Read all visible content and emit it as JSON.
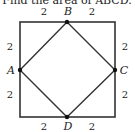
{
  "caption": "Find the area of ABCD.",
  "square": {
    "x1": 20,
    "y1": 22,
    "x2": 115,
    "y2": 117,
    "stroke": "#333333"
  },
  "points": [
    {
      "name": "A",
      "x": 20,
      "y": 70,
      "label_x": 12,
      "label_y": 74
    },
    {
      "name": "B",
      "x": 67,
      "y": 22,
      "label_x": 67,
      "label_y": 14
    },
    {
      "name": "C",
      "x": 115,
      "y": 70,
      "label_x": 123,
      "label_y": 74
    },
    {
      "name": "D",
      "x": 67,
      "y": 117,
      "label_x": 67,
      "label_y": 130
    }
  ],
  "segment_labels": {
    "top_left": "2",
    "top_right": "2",
    "left_top": "2",
    "left_bottom": "2",
    "right_top": "2",
    "right_bottom": "2",
    "bottom_left": "2",
    "bottom_right": "2"
  },
  "colors": {
    "line": "#333333",
    "point": "#111111",
    "text": "#222222"
  }
}
